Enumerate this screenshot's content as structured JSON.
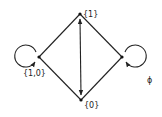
{
  "diagram": {
    "type": "state-transition-graph",
    "colors": {
      "stroke": "#222222",
      "background": "#ffffff"
    },
    "nodes": [
      {
        "id": "top",
        "label": "{1}",
        "x": 80,
        "y": 14
      },
      {
        "id": "left",
        "label": "{1,0}",
        "x": 39,
        "y": 57
      },
      {
        "id": "right",
        "label": "ϕ",
        "x": 122,
        "y": 57
      },
      {
        "id": "bottom",
        "label": "{0}",
        "x": 81,
        "y": 100
      }
    ],
    "edges": [
      {
        "from": "top",
        "to": "left",
        "directed": false
      },
      {
        "from": "top",
        "to": "right",
        "directed": false
      },
      {
        "from": "left",
        "to": "bottom",
        "directed": false
      },
      {
        "from": "right",
        "to": "bottom",
        "directed": false
      },
      {
        "from": "top",
        "to": "bottom",
        "directed": true,
        "bidirectional": true
      },
      {
        "from": "left",
        "to": "left",
        "self_loop": true
      },
      {
        "from": "right",
        "to": "right",
        "self_loop": true
      }
    ]
  }
}
